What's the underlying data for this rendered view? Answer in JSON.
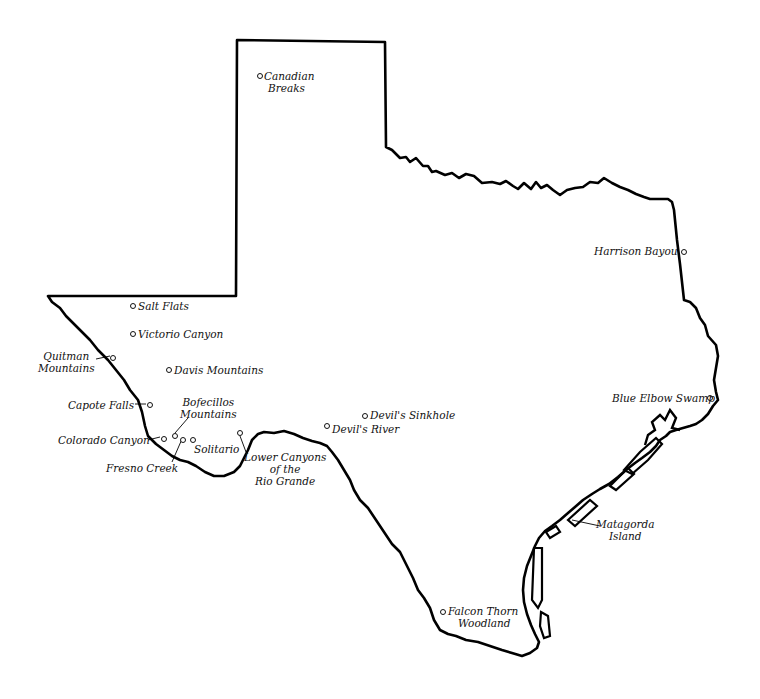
{
  "map": {
    "region": "Texas",
    "colors": {
      "outline": "#000000",
      "background": "#ffffff",
      "text": "#111111"
    },
    "places": [
      {
        "id": "canadian-breaks",
        "line1": "Canadian",
        "line2": "Breaks"
      },
      {
        "id": "salt-flats",
        "line1": "Salt Flats"
      },
      {
        "id": "victorio-canyon",
        "line1": "Victorio Canyon"
      },
      {
        "id": "quitman-mountains",
        "line1": "Quitman",
        "line2": "Mountains"
      },
      {
        "id": "davis-mountains",
        "line1": "Davis Mountains"
      },
      {
        "id": "capote-falls",
        "line1": "Capote Falls"
      },
      {
        "id": "bofecillos-mountains",
        "line1": "Bofecillos",
        "line2": "Mountains"
      },
      {
        "id": "colorado-canyon",
        "line1": "Colorado Canyon"
      },
      {
        "id": "solitario",
        "line1": "Solitario"
      },
      {
        "id": "fresno-creek",
        "line1": "Fresno Creek"
      },
      {
        "id": "lower-canyons",
        "line1": "Lower Canyons",
        "line2": "of the",
        "line3": "Rio Grande"
      },
      {
        "id": "devils-sinkhole",
        "line1": "Devil's Sinkhole"
      },
      {
        "id": "devils-river",
        "line1": "Devil's River"
      },
      {
        "id": "harrison-bayou",
        "line1": "Harrison Bayou"
      },
      {
        "id": "blue-elbow-swamp",
        "line1": "Blue Elbow Swamp"
      },
      {
        "id": "matagorda-island",
        "line1": "Matagorda",
        "line2": "Island"
      },
      {
        "id": "falcon-thorn-woodland",
        "line1": "Falcon Thorn",
        "line2": "Woodland"
      }
    ]
  }
}
